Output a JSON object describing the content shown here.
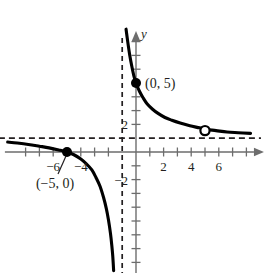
{
  "figure": {
    "kind": "cartesian-graph",
    "width": 267,
    "height": 273,
    "background": "#ffffff",
    "ink_color": "#231f20",
    "axis_color": "#6d6d6d",
    "curve_color": "#000000",
    "top_cropped_text": "· · ·"
  },
  "axes": {
    "x_label": "x",
    "y_label": "y",
    "origin_px": {
      "x": 136,
      "y": 152
    },
    "unit_px": 13.8,
    "x_tick_labels": [
      {
        "text": "−6",
        "value": -6
      },
      {
        "text": "−4",
        "value": -4
      },
      {
        "text": "2",
        "value": 2
      },
      {
        "text": "4",
        "value": 4
      },
      {
        "text": "6",
        "value": 6
      }
    ],
    "y_tick_labels": [
      {
        "text": "2",
        "value": 2
      },
      {
        "text": "−2",
        "value": -2
      }
    ],
    "x_ticks_values": [
      -8,
      -7,
      -6,
      -5,
      -4,
      -3,
      -2,
      1,
      2,
      3,
      4,
      5,
      6,
      7,
      8
    ],
    "y_ticks_values": [
      -8,
      -7,
      -6,
      -5,
      -4,
      -3,
      -2,
      -1,
      2,
      3,
      4,
      5,
      6,
      7,
      8
    ],
    "xlim": [
      -9.5,
      9.2
    ],
    "ylim": [
      -8.8,
      8.7
    ],
    "grid": false
  },
  "chart_data": {
    "type": "line",
    "title": "",
    "xlabel": "x",
    "ylabel": "y",
    "xlim": [
      -9.5,
      9.2
    ],
    "ylim": [
      -8.8,
      8.7
    ],
    "grid": false,
    "legend": "none",
    "asymptotes": [
      {
        "name": "vertical-asymptote",
        "orientation": "vertical",
        "value": -1,
        "style": "dashed"
      },
      {
        "name": "horizontal-asymptote",
        "orientation": "horizontal",
        "value": 1,
        "style": "dashed"
      }
    ],
    "series": [
      {
        "name": "right-branch",
        "style": "solid",
        "points": [
          [
            -0.72,
            8.9
          ],
          [
            -0.6,
            8.0
          ],
          [
            -0.45,
            7.0
          ],
          [
            -0.3,
            6.2
          ],
          [
            -0.15,
            5.5
          ],
          [
            0,
            5.0
          ],
          [
            0.25,
            4.4
          ],
          [
            0.5,
            3.95
          ],
          [
            0.8,
            3.5
          ],
          [
            1.2,
            3.1
          ],
          [
            1.6,
            2.8
          ],
          [
            2.1,
            2.5
          ],
          [
            2.6,
            2.3
          ],
          [
            3.2,
            2.1
          ],
          [
            3.9,
            1.9
          ],
          [
            4.6,
            1.75
          ],
          [
            5,
            1.65
          ],
          [
            5.8,
            1.55
          ],
          [
            6.6,
            1.45
          ],
          [
            7.4,
            1.4
          ],
          [
            8.3,
            1.35
          ]
        ]
      },
      {
        "name": "left-branch",
        "style": "solid",
        "points": [
          [
            -9.3,
            0.72
          ],
          [
            -8.6,
            0.65
          ],
          [
            -7.8,
            0.55
          ],
          [
            -7.0,
            0.42
          ],
          [
            -6.3,
            0.3
          ],
          [
            -5.6,
            0.15
          ],
          [
            -5.0,
            0.0
          ],
          [
            -4.5,
            -0.2
          ],
          [
            -4.0,
            -0.5
          ],
          [
            -3.6,
            -0.85
          ],
          [
            -3.2,
            -1.3
          ],
          [
            -2.9,
            -1.85
          ],
          [
            -2.6,
            -2.5
          ],
          [
            -2.35,
            -3.3
          ],
          [
            -2.15,
            -4.1
          ],
          [
            -2.0,
            -4.9
          ],
          [
            -1.85,
            -5.9
          ],
          [
            -1.75,
            -6.8
          ],
          [
            -1.68,
            -7.6
          ],
          [
            -1.62,
            -8.6
          ]
        ]
      }
    ],
    "marked_points": [
      {
        "name": "y-intercept",
        "x": 0,
        "y": 5,
        "marker": "filled-circle",
        "label": "(0, 5)"
      },
      {
        "name": "x-intercept",
        "x": -5,
        "y": 0,
        "marker": "filled-circle",
        "label": "(−5, 0)"
      },
      {
        "name": "removable-hole",
        "x": 5,
        "y": 1.55,
        "marker": "open-circle",
        "label": ""
      }
    ]
  },
  "annotations": {
    "y_intercept_label": "(0, 5)",
    "x_intercept_label": "(−5, 0)"
  }
}
